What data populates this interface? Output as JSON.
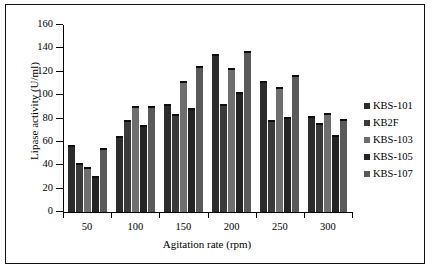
{
  "chart_data": {
    "type": "bar",
    "title": "",
    "subtitle": "",
    "xlabel": "Agitation rate (rpm)",
    "ylabel": "Lipase activity (U/ml)",
    "categories": [
      "50",
      "100",
      "150",
      "200",
      "250",
      "300"
    ],
    "ylim": [
      0,
      160
    ],
    "yticks": [
      0,
      20,
      40,
      60,
      80,
      100,
      120,
      140,
      160
    ],
    "ytick_labels": [
      "0",
      "20",
      "40",
      "60",
      "80",
      "100",
      "120",
      "140",
      "160"
    ],
    "grid": false,
    "legend_position": "right",
    "series": [
      {
        "name": "KBS-101",
        "color": "#2b2b2b",
        "values": [
          57,
          65,
          92,
          135.5,
          112,
          82
        ]
      },
      {
        "name": "KB2F",
        "color": "#3a3a3a",
        "values": [
          42,
          78.5,
          84,
          92.5,
          79,
          76
        ]
      },
      {
        "name": "KBS-103",
        "color": "#6e6e6e",
        "values": [
          38.5,
          91,
          112,
          123,
          107,
          85
        ]
      },
      {
        "name": "KBS-105",
        "color": "#242424",
        "values": [
          31,
          74.5,
          89,
          102.5,
          81,
          66
        ]
      },
      {
        "name": "KBS-107",
        "color": "#5a5a5a",
        "values": [
          54.5,
          90.5,
          125,
          138,
          117,
          80
        ]
      }
    ]
  },
  "legend": {
    "items": [
      {
        "label": "KBS-101",
        "swatch": "#2b2b2b"
      },
      {
        "label": "KB2F",
        "swatch": "#3a3a3a"
      },
      {
        "label": "KBS-103",
        "swatch": "#6e6e6e"
      },
      {
        "label": "KBS-105",
        "swatch": "#242424"
      },
      {
        "label": "KBS-107",
        "swatch": "#5a5a5a"
      }
    ]
  },
  "axes": {
    "y_title": "Lipase activity (U/ml)",
    "x_title": "Agitation rate (rpm)"
  }
}
